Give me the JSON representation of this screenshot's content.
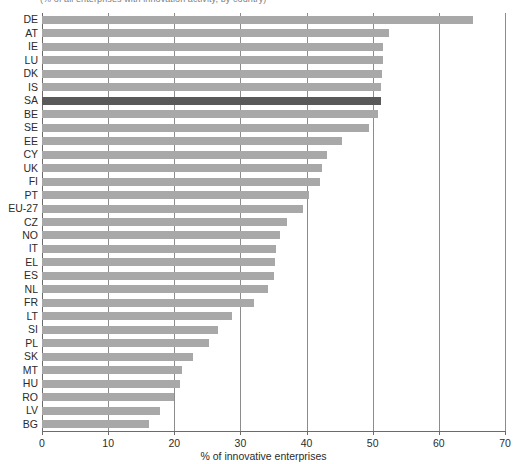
{
  "chart_data": {
    "type": "bar",
    "orientation": "horizontal",
    "title": "",
    "xlabel": "% of innovative enterprises",
    "ylabel": "",
    "xlim": [
      0,
      70
    ],
    "xticks": [
      0,
      10,
      20,
      30,
      40,
      50,
      60,
      70
    ],
    "grid": true,
    "legend": null,
    "highlight_category": "SA",
    "colors": {
      "bar": "#a8a8a8",
      "bar_highlight": "#595959",
      "gridline": "#8c8c8c",
      "axis": "#6b6b6b",
      "text": "#2b2b2b"
    },
    "categories": [
      "DE",
      "AT",
      "IE",
      "LU",
      "DK",
      "IS",
      "SA",
      "BE",
      "SE",
      "EE",
      "CY",
      "UK",
      "FI",
      "PT",
      "EU-27",
      "CZ",
      "NO",
      "IT",
      "EL",
      "ES",
      "NL",
      "FR",
      "LT",
      "SI",
      "PL",
      "SK",
      "MT",
      "HU",
      "RO",
      "LV",
      "BG"
    ],
    "values": [
      65.2,
      52.4,
      51.5,
      51.5,
      51.4,
      51.2,
      51.2,
      50.8,
      49.5,
      45.3,
      43.1,
      42.4,
      42.0,
      40.4,
      39.4,
      37.1,
      36.0,
      35.4,
      35.2,
      35.0,
      34.2,
      32.1,
      28.7,
      26.6,
      25.2,
      22.8,
      21.2,
      20.8,
      20.0,
      17.9,
      16.2
    ]
  },
  "axis": {
    "x_title": "% of innovative enterprises",
    "tick_labels": [
      "0",
      "10",
      "20",
      "30",
      "40",
      "50",
      "60",
      "70"
    ]
  },
  "header": {
    "clipped_title": "(% of all enterprises with innovation activity, by country)"
  }
}
